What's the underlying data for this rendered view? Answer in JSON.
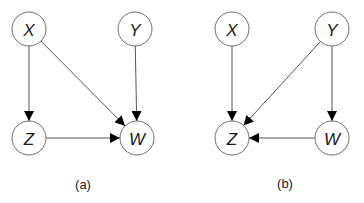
{
  "figure": {
    "node_radius": 17,
    "colors": {
      "node_stroke": "#6e6e6e",
      "edge": "#555555",
      "arrowhead": "#000000",
      "text": "#1a1a1a",
      "background": "#ffffff"
    },
    "panels": [
      {
        "id": "a",
        "caption": "(a)",
        "caption_pos": [
          83,
          184
        ],
        "nodes": [
          {
            "id": "X",
            "label": "X",
            "x": 29,
            "y": 29
          },
          {
            "id": "Y",
            "label": "Y",
            "x": 135,
            "y": 29
          },
          {
            "id": "Z",
            "label": "Z",
            "x": 29,
            "y": 138
          },
          {
            "id": "W",
            "label": "W",
            "x": 137,
            "y": 138
          }
        ],
        "edges": [
          {
            "from": "X",
            "to": "Z"
          },
          {
            "from": "X",
            "to": "W"
          },
          {
            "from": "Y",
            "to": "W"
          },
          {
            "from": "Z",
            "to": "W"
          }
        ]
      },
      {
        "id": "b",
        "caption": "(b)",
        "caption_pos": [
          285,
          183
        ],
        "nodes": [
          {
            "id": "X",
            "label": "X",
            "x": 232,
            "y": 29
          },
          {
            "id": "Y",
            "label": "Y",
            "x": 332,
            "y": 29
          },
          {
            "id": "Z",
            "label": "Z",
            "x": 232,
            "y": 138
          },
          {
            "id": "W",
            "label": "W",
            "x": 332,
            "y": 138
          }
        ],
        "edges": [
          {
            "from": "X",
            "to": "Z"
          },
          {
            "from": "Y",
            "to": "Z"
          },
          {
            "from": "Y",
            "to": "W"
          },
          {
            "from": "W",
            "to": "Z"
          }
        ]
      }
    ]
  }
}
